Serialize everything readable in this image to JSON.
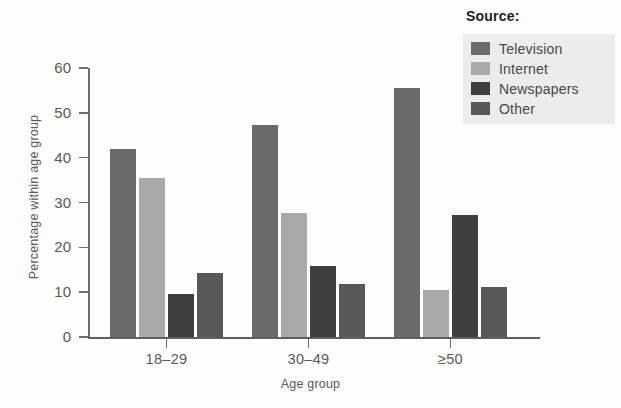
{
  "chart_data": {
    "type": "bar",
    "title": "",
    "xlabel": "Age group",
    "ylabel": "Percentage within age group",
    "ylim": [
      0,
      60
    ],
    "yticks": [
      0,
      10,
      20,
      30,
      40,
      50,
      60
    ],
    "grid": false,
    "legend_title": "Source:",
    "legend_position": "top-right",
    "categories": [
      "18–29",
      "30–49",
      "≥50"
    ],
    "series": [
      {
        "name": "Television",
        "color": "#6b6b6b",
        "values": [
          42.0,
          47.3,
          55.5
        ]
      },
      {
        "name": "Internet",
        "color": "#a9a9a7",
        "values": [
          35.5,
          27.7,
          10.4
        ]
      },
      {
        "name": "Newspapers",
        "color": "#3f3f3f",
        "values": [
          9.7,
          15.9,
          27.2
        ]
      },
      {
        "name": "Other",
        "color": "#585858",
        "values": [
          14.3,
          11.8,
          11.2
        ]
      }
    ]
  },
  "legend": {
    "title": "Source:",
    "items": [
      {
        "label": "Television"
      },
      {
        "label": "Internet"
      },
      {
        "label": "Newspapers"
      },
      {
        "label": "Other"
      }
    ]
  },
  "axes": {
    "y_title": "Percentage within age group",
    "x_title": "Age group",
    "y_tick_labels": [
      "0",
      "10",
      "20",
      "30",
      "40",
      "50",
      "60"
    ],
    "x_tick_labels": [
      "18–29",
      "30–49",
      "≥50"
    ]
  },
  "colors": {
    "background": "#fdfdfb",
    "axis": "#6f6f6f",
    "text": "#5a5a5a",
    "legend_panel": "#ececeb"
  }
}
